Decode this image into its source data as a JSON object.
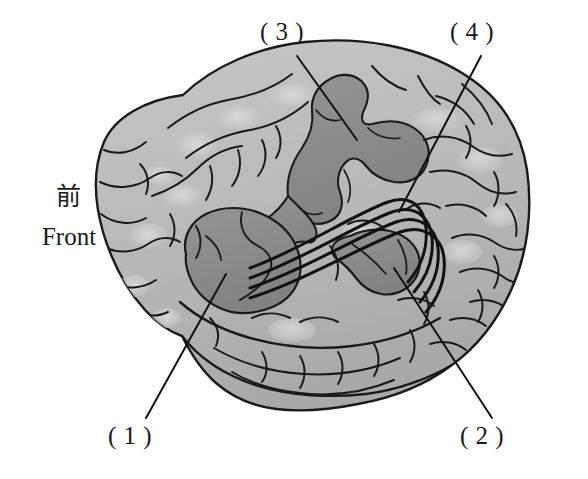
{
  "figure": {
    "orientation_label": {
      "cjk": "前",
      "latin": "Front"
    },
    "callouts": [
      {
        "id": "1",
        "label": "( 1 )",
        "target": "broca-area",
        "x": 108,
        "y": 422
      },
      {
        "id": "2",
        "label": "( 2 )",
        "target": "wernicke-area",
        "x": 460,
        "y": 422
      },
      {
        "id": "3",
        "label": "( 3 )",
        "target": "motor-cortex-band",
        "x": 260,
        "y": 18
      },
      {
        "id": "4",
        "label": "( 4 )",
        "target": "arcuate-fasciculus",
        "x": 450,
        "y": 18
      }
    ],
    "regions": [
      {
        "name": "broca-area",
        "callout": "1",
        "shade": "dark"
      },
      {
        "name": "wernicke-area",
        "callout": "2",
        "shade": "dark"
      },
      {
        "name": "motor-cortex-band",
        "callout": "3",
        "shade": "dark"
      },
      {
        "name": "arcuate-fasciculus",
        "callout": "4",
        "shade": "lines"
      }
    ],
    "colors": {
      "background": "#ffffff",
      "cortex_light": "#b9b9b9",
      "cortex_highlight": "#d8d8d8",
      "region_dark": "#8b8b8b",
      "region_dark_edge": "#7a7a7a",
      "outline": "#1a1a1a",
      "text": "#1a1a1a"
    }
  }
}
